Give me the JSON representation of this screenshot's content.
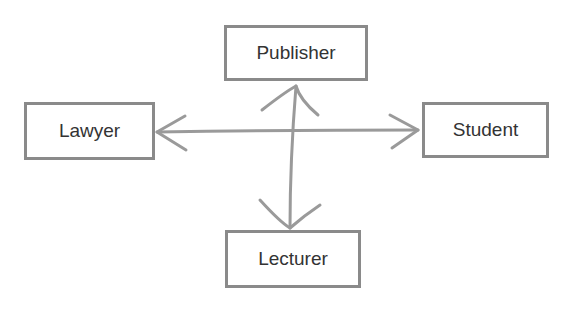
{
  "diagram": {
    "nodes": [
      {
        "id": "publisher",
        "label": "Publisher"
      },
      {
        "id": "lawyer",
        "label": "Lawyer"
      },
      {
        "id": "student",
        "label": "Student"
      },
      {
        "id": "lecturer",
        "label": "Lecturer"
      }
    ],
    "edges": [
      {
        "from": "lawyer",
        "to": "student",
        "type": "bidirectional"
      },
      {
        "from": "publisher",
        "to": "lecturer",
        "type": "bidirectional"
      }
    ],
    "colors": {
      "stroke": "#8a8a8a",
      "text": "#333333"
    }
  }
}
